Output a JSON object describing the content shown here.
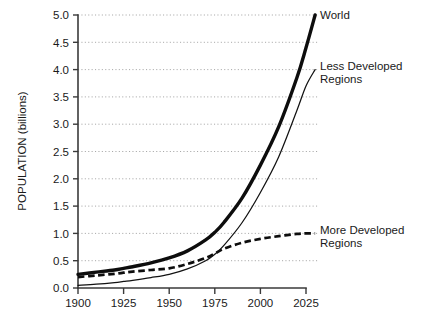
{
  "chart_data": {
    "type": "line",
    "title": "",
    "subtitle": "",
    "xlabel": "",
    "ylabel": "POPULATION (billions)",
    "xlim": [
      1900,
      2025
    ],
    "ylim": [
      0.0,
      5.0
    ],
    "grid": true,
    "grid_style": "dotted-horizontal",
    "legend_position": "right-inline-labels",
    "xticks": [
      1900,
      1925,
      1950,
      1975,
      2000,
      2025
    ],
    "xtick_labels": [
      "1900",
      "1925",
      "1950",
      "1975",
      "2000",
      "2025"
    ],
    "yticks": [
      0.0,
      0.5,
      1.0,
      1.5,
      2.0,
      2.5,
      3.0,
      3.5,
      4.0,
      4.5,
      5.0
    ],
    "ytick_labels": [
      "0.0",
      "0.5",
      "1.0",
      "1.5",
      "2.0",
      "2.5",
      "3.0",
      "3.5",
      "4.0",
      "4.5",
      "5.0"
    ],
    "x": [
      1900,
      1910,
      1920,
      1925,
      1930,
      1940,
      1950,
      1960,
      1970,
      1975,
      1980,
      1990,
      2000,
      2010,
      2020,
      2025,
      2030
    ],
    "series": [
      {
        "name": "World",
        "style": "thick-solid",
        "color": "#0d0d0d",
        "values": [
          0.25,
          0.29,
          0.33,
          0.36,
          0.39,
          0.46,
          0.55,
          0.68,
          0.88,
          1.02,
          1.2,
          1.65,
          2.25,
          2.95,
          3.85,
          4.4,
          5.0
        ]
      },
      {
        "name": "Less Developed Regions",
        "style": "thin-solid",
        "color": "#121212",
        "values": [
          0.05,
          0.07,
          0.1,
          0.12,
          0.14,
          0.19,
          0.25,
          0.35,
          0.5,
          0.62,
          0.78,
          1.2,
          1.75,
          2.4,
          3.25,
          3.7,
          4.0
        ]
      },
      {
        "name": "More Developed Regions",
        "style": "dashed",
        "color": "#0d0d0d",
        "values": [
          0.2,
          0.23,
          0.26,
          0.28,
          0.3,
          0.33,
          0.36,
          0.44,
          0.55,
          0.63,
          0.72,
          0.83,
          0.9,
          0.95,
          0.99,
          1.0,
          1.0
        ]
      }
    ],
    "annotations": [
      {
        "name": "World",
        "text": "World",
        "attached_to": "World",
        "x": 2030,
        "y": 5.0
      },
      {
        "name": "Less Developed Regions",
        "text": "Less Developed\nRegions",
        "line1": "Less Developed",
        "line2": "Regions",
        "attached_to": "Less Developed Regions",
        "x": 2030,
        "y": 4.0
      },
      {
        "name": "More Developed Regions",
        "text": "More Developed\nRegions",
        "line1": "More Developed",
        "line2": "Regions",
        "attached_to": "More Developed Regions",
        "x": 2030,
        "y": 1.0
      }
    ]
  },
  "axes": {
    "y_title": "POPULATION (billions)"
  },
  "labels": {
    "world": "World",
    "less_developed_line1": "Less Developed",
    "less_developed_line2": "Regions",
    "more_developed_line1": "More Developed",
    "more_developed_line2": "Regions"
  },
  "ticks": {
    "y": [
      "5.0",
      "4.5",
      "4.0",
      "3.5",
      "3.0",
      "2.5",
      "2.0",
      "1.5",
      "1.0",
      "0.5",
      "0.0"
    ],
    "x": [
      "1900",
      "1925",
      "1950",
      "1975",
      "2000",
      "2025"
    ]
  },
  "colors": {
    "background": "#ffffff",
    "axis": "#3a3a3a",
    "grid": "#9a9a9a",
    "series_world": "#0d0d0d",
    "series_less_developed": "#121212",
    "series_more_developed": "#0d0d0d",
    "text": "#1a1a1a"
  }
}
